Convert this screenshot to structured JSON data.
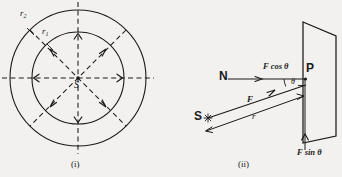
{
  "figure": {
    "title": "",
    "background_color": "#f2f1ef",
    "ink_color": "#1a1a1a",
    "panels": [
      {
        "id": "panel-i",
        "caption": "(i)",
        "description": "Concentric circles with radial dashed arrows from point source",
        "labels": {
          "source": "S",
          "inner_radius": "r",
          "inner_radius_sub": "1",
          "outer_radius": "r",
          "outer_radius_sub": "2"
        },
        "geometry": {
          "center_x": 78,
          "center_y": 78,
          "inner_radius_px": 46,
          "outer_radius_px": 68,
          "ray_count": 8,
          "ray_angles_deg": [
            0,
            45,
            90,
            135,
            180,
            225,
            270,
            315
          ]
        }
      },
      {
        "id": "panel-ii",
        "caption": "(ii)",
        "description": "Force vector resolved into components at a plane",
        "labels": {
          "normal_point": "N",
          "source": "S",
          "plane_point": "P",
          "angle": "θ",
          "force": "F",
          "distance": "r",
          "component_horizontal": "F cos θ",
          "component_vertical": "F sin θ"
        }
      }
    ]
  }
}
